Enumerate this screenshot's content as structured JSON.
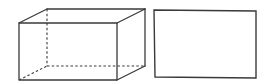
{
  "figure": {
    "stroke_color": "#3a3a3a",
    "background": "#ffffff"
  },
  "cuboid": {
    "front_face": {
      "x1": 19,
      "y1": 23,
      "x2": 117,
      "y2": 80
    },
    "back_face": {
      "x1": 47,
      "y1": 9,
      "x2": 145,
      "y2": 66
    },
    "hidden_edges": "dashed"
  },
  "rectangle": {
    "x1": 154,
    "y1": 10,
    "x2": 256,
    "y2": 78
  }
}
